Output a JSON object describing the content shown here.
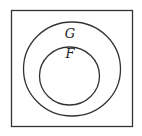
{
  "diagram": {
    "type": "venn",
    "universe": {
      "label": ""
    },
    "sets": [
      {
        "id": "G",
        "label": "G",
        "contains": [
          "F"
        ]
      },
      {
        "id": "F",
        "label": "F",
        "subset_of": "G"
      }
    ],
    "relation": "F ⊂ G",
    "colors": {
      "stroke": "#333333",
      "background": "#ffffff"
    }
  }
}
